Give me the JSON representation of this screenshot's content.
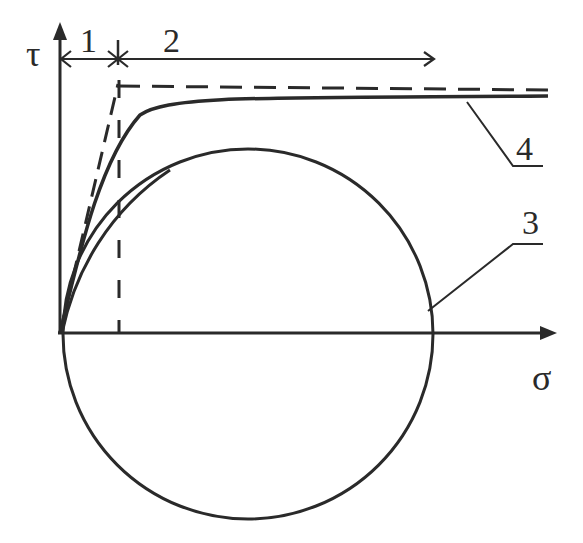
{
  "diagram": {
    "type": "Mohr stress diagram with failure envelopes",
    "axes": {
      "x_label": "σ",
      "y_label": "τ"
    },
    "region_labels": {
      "region_1": "1",
      "region_2": "2"
    },
    "curve_labels": {
      "circle": "3",
      "envelope": "4"
    },
    "elements": [
      {
        "id": "1",
        "description": "dimension arrow span from τ-axis to transition point"
      },
      {
        "id": "2",
        "description": "dimension arrow span to the right of transition point"
      },
      {
        "id": "3",
        "description": "Mohr circle centered on σ-axis"
      },
      {
        "id": "4",
        "description": "solid curved envelope approaching dashed bilinear asymptote"
      }
    ],
    "colors": {
      "ink": "#2a2a2a",
      "background": "#ffffff"
    }
  }
}
